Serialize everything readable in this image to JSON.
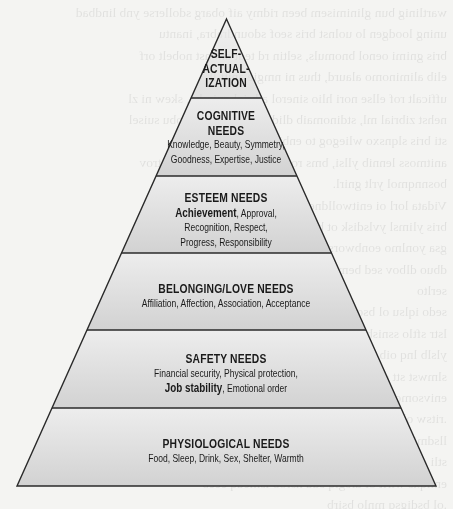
{
  "diagram": {
    "type": "pyramid",
    "levels_top_to_bottom": [
      {
        "id": "self-actualization",
        "title_lines": [
          "SELF-",
          "ACTUAL-",
          "IZATION"
        ],
        "items": []
      },
      {
        "id": "cognitive",
        "title_lines": [
          "COGNITIVE",
          "NEEDS"
        ],
        "item_lines": [
          "Knowledge, Beauty, Symmetry,",
          "Goodness, Expertise, Justice"
        ]
      },
      {
        "id": "esteem",
        "title_lines": [
          "ESTEEM NEEDS"
        ],
        "emphasized_item": "Achievement",
        "item_lines": [
          ", Approval,",
          "Recognition, Respect,",
          "Progress, Responsibility"
        ]
      },
      {
        "id": "belonging-love",
        "title_lines": [
          "BELONGING/LOVE NEEDS"
        ],
        "item_lines": [
          "Affiliation, Affection, Association, Acceptance"
        ]
      },
      {
        "id": "safety",
        "title_lines": [
          "SAFETY NEEDS"
        ],
        "item_lines": [
          "Financial security, Physical protection,"
        ],
        "emphasized_item": "Job stability",
        "item_tail": ", Emotional order"
      },
      {
        "id": "physiological",
        "title_lines": [
          "PHYSIOLOGICAL NEEDS"
        ],
        "item_lines": [
          "Food, Sleep, Drink, Sex, Shelter, Warmth"
        ]
      }
    ],
    "colors": {
      "page_background": "#f4f4f2",
      "tier_fill_top": "#ececec",
      "tier_fill_bottom": "#d3d3d3",
      "outline": "#2a2a2a",
      "text": "#1a1a1a"
    }
  },
  "background_bleed_text": [
    "... stability and meaningful ... (illegible reverse-side text)",
    "... feature.",
    "The ... (illegible)",
    "... (illegible)",
    "... (illegible)",
    "... (illegible)",
    "... (illegible)",
    "... (illegible)",
    "... (illegible)",
    "... (illegible)",
    "... (illegible)",
    "... (illegible)",
    "... (illegible)",
    "... (illegible)",
    "... (illegible)",
    "... (illegible)",
    "... (illegible)",
    "... (illegible)",
    "... (illegible)",
    "... (illegible)",
    "... (illegible)",
    "... (illegible)",
    "... (illegible)",
    "... (illegible)"
  ]
}
